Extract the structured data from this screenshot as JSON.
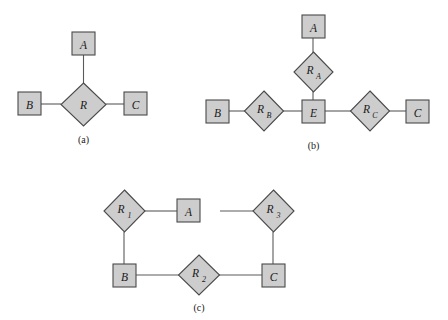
{
  "figure": {
    "background_color": "#ffffff",
    "shape_fill_color": "#cdcdcd",
    "shape_stroke_color": "#4a4a4a",
    "edge_color": "#5a5a5a",
    "text_color": "#1a1a1a"
  },
  "panels": [
    {
      "id": "a",
      "caption": "(a)",
      "entities": [
        {
          "key": "a_A",
          "label": "A",
          "sub": ""
        },
        {
          "key": "a_B",
          "label": "B",
          "sub": ""
        },
        {
          "key": "a_C",
          "label": "C",
          "sub": ""
        }
      ],
      "relationships": [
        {
          "key": "a_R",
          "label": "R",
          "sub": ""
        }
      ],
      "edges": [
        {
          "from": "a_R",
          "to": "a_A"
        },
        {
          "from": "a_B",
          "to": "a_R"
        },
        {
          "from": "a_R",
          "to": "a_C"
        }
      ]
    },
    {
      "id": "b",
      "caption": "(b)",
      "entities": [
        {
          "key": "b_A",
          "label": "A",
          "sub": ""
        },
        {
          "key": "b_B",
          "label": "B",
          "sub": ""
        },
        {
          "key": "b_C",
          "label": "C",
          "sub": ""
        },
        {
          "key": "b_E",
          "label": "E",
          "sub": ""
        }
      ],
      "relationships": [
        {
          "key": "b_RA",
          "label": "R",
          "sub": "A"
        },
        {
          "key": "b_RB",
          "label": "R",
          "sub": "B"
        },
        {
          "key": "b_RC",
          "label": "R",
          "sub": "C"
        }
      ],
      "edges": [
        {
          "from": "b_A",
          "to": "b_RA"
        },
        {
          "from": "b_RA",
          "to": "b_E"
        },
        {
          "from": "b_B",
          "to": "b_RB"
        },
        {
          "from": "b_RB",
          "to": "b_E"
        },
        {
          "from": "b_E",
          "to": "b_RC"
        },
        {
          "from": "b_RC",
          "to": "b_C"
        }
      ]
    },
    {
      "id": "c",
      "caption": "(c)",
      "entities": [
        {
          "key": "c_A",
          "label": "A",
          "sub": ""
        },
        {
          "key": "c_B",
          "label": "B",
          "sub": ""
        },
        {
          "key": "c_C",
          "label": "C",
          "sub": ""
        }
      ],
      "relationships": [
        {
          "key": "c_R1",
          "label": "R",
          "sub": "1"
        },
        {
          "key": "c_R2",
          "label": "R",
          "sub": "2"
        },
        {
          "key": "c_R3",
          "label": "R",
          "sub": "3"
        }
      ],
      "edges": [
        {
          "from": "c_R1",
          "to": "c_A"
        },
        {
          "from": "c_A",
          "to": "c_R3"
        },
        {
          "from": "c_R1",
          "to": "c_B"
        },
        {
          "from": "c_B",
          "to": "c_R2"
        },
        {
          "from": "c_R2",
          "to": "c_C"
        },
        {
          "from": "c_R3",
          "to": "c_C"
        }
      ]
    }
  ]
}
